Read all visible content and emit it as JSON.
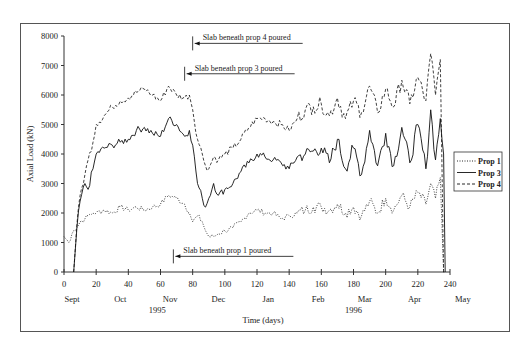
{
  "chart_data": {
    "type": "line",
    "title": "",
    "xlabel": "Time (days)",
    "ylabel": "Axial Load (kN)",
    "xlim": [
      0,
      240
    ],
    "ylim": [
      0,
      8000
    ],
    "x_ticks": [
      0,
      20,
      40,
      60,
      80,
      100,
      120,
      140,
      160,
      180,
      200,
      220,
      240
    ],
    "y_ticks": [
      0,
      1000,
      2000,
      3000,
      4000,
      5000,
      6000,
      7000,
      8000
    ],
    "month_labels": [
      {
        "label": "Sept",
        "day": 5
      },
      {
        "label": "Oct",
        "day": 35
      },
      {
        "label": "Nov",
        "day": 66
      },
      {
        "label": "Dec",
        "day": 96
      },
      {
        "label": "Jan",
        "day": 127
      },
      {
        "label": "Feb",
        "day": 158
      },
      {
        "label": "Mar",
        "day": 187
      },
      {
        "label": "Apr",
        "day": 218
      },
      {
        "label": "May",
        "day": 248
      }
    ],
    "year_labels": [
      {
        "label": "1995",
        "day": 58
      },
      {
        "label": "1996",
        "day": 180
      }
    ],
    "grid": false,
    "legend_position": "right",
    "x": [
      0,
      3,
      5,
      6,
      8,
      10,
      13,
      15,
      18,
      20,
      25,
      30,
      35,
      40,
      45,
      50,
      55,
      60,
      65,
      70,
      75,
      78,
      80,
      83,
      86,
      88,
      90,
      93,
      96,
      100,
      105,
      110,
      115,
      120,
      125,
      130,
      135,
      140,
      145,
      150,
      155,
      160,
      165,
      170,
      175,
      180,
      185,
      190,
      195,
      200,
      205,
      210,
      215,
      220,
      225,
      228,
      231,
      234,
      236,
      237
    ],
    "series": [
      {
        "name": "Prop 1",
        "style": "dotted",
        "values": [
          1200,
          1000,
          1300,
          1400,
          1500,
          1700,
          1800,
          1900,
          2000,
          2000,
          2100,
          2000,
          2200,
          2100,
          2200,
          2100,
          2200,
          2300,
          2600,
          2500,
          2300,
          2000,
          1700,
          1900,
          1700,
          1400,
          1200,
          1200,
          1300,
          1400,
          1500,
          1700,
          2000,
          2100,
          2000,
          2000,
          1800,
          1900,
          2000,
          2100,
          2200,
          2200,
          2100,
          2300,
          2000,
          2200,
          1900,
          2400,
          2000,
          2500,
          2100,
          2600,
          2200,
          2700,
          2300,
          3000,
          2500,
          3200,
          0,
          0
        ]
      },
      {
        "name": "Prop 3",
        "style": "solid",
        "values": [
          null,
          null,
          null,
          0,
          1500,
          2400,
          3000,
          2800,
          3500,
          4000,
          4200,
          4300,
          4400,
          4500,
          4800,
          4900,
          4700,
          4600,
          5200,
          5000,
          4600,
          4800,
          4300,
          3000,
          2500,
          2200,
          2500,
          3000,
          2600,
          2800,
          3000,
          3400,
          3700,
          4000,
          3900,
          3800,
          3700,
          3500,
          3900,
          4000,
          4100,
          4200,
          3700,
          4500,
          3500,
          4200,
          3300,
          4800,
          3600,
          4700,
          3600,
          4900,
          3700,
          5000,
          3500,
          5500,
          3800,
          5200,
          4000,
          0
        ]
      },
      {
        "name": "Prop 4",
        "style": "dashed",
        "values": [
          null,
          null,
          null,
          0,
          1600,
          2600,
          3300,
          3800,
          4400,
          5000,
          5300,
          5600,
          5800,
          5900,
          6100,
          6200,
          6000,
          5800,
          6300,
          6000,
          5900,
          6000,
          5500,
          4500,
          4000,
          3600,
          3500,
          3900,
          3800,
          4000,
          4200,
          4500,
          4900,
          5200,
          5200,
          5100,
          5000,
          4800,
          5200,
          5500,
          5600,
          5700,
          5300,
          5900,
          5200,
          5800,
          5400,
          6300,
          5400,
          6200,
          5600,
          6500,
          5700,
          6600,
          5800,
          7400,
          6000,
          7200,
          0,
          0
        ]
      }
    ],
    "annotations": [
      {
        "text": "Slab beneath prop 4 poured",
        "arrow_to_day": 80,
        "value": 7750
      },
      {
        "text": "Slab beneath prop 3 poured",
        "arrow_to_day": 75,
        "value": 6720
      },
      {
        "text": "Slab beneath prop 1 poured",
        "arrow_to_day": 68,
        "value": 530
      }
    ]
  },
  "legend": {
    "items": [
      {
        "label": "Prop 1",
        "style": "dotted"
      },
      {
        "label": "Prop 3",
        "style": "solid"
      },
      {
        "label": "Prop 4",
        "style": "dashed"
      }
    ]
  },
  "colors": {
    "line": "#111111",
    "axis": "#333333",
    "frame": "#555555"
  }
}
